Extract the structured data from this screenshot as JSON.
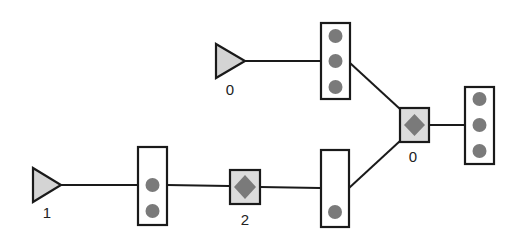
{
  "diagram": {
    "type": "network-topology",
    "colors": {
      "stroke": "#1a1a1a",
      "triangle_fill": "#d4d4d4",
      "switch_fill": "#dcdcdc",
      "packet_dot": "#7a7a7a",
      "buffer_fill": "#ffffff"
    },
    "sources": [
      {
        "id": "source-0",
        "label": "0"
      },
      {
        "id": "source-1",
        "label": "1"
      }
    ],
    "switches": [
      {
        "id": "switch-0",
        "label": "0"
      },
      {
        "id": "switch-2",
        "label": "2"
      }
    ],
    "buffers": [
      {
        "id": "buffer-top",
        "packets": 3
      },
      {
        "id": "buffer-right",
        "packets": 3
      },
      {
        "id": "buffer-left",
        "packets": 2
      },
      {
        "id": "buffer-bottom",
        "packets": 1
      }
    ],
    "edges": [
      [
        "source-0",
        "buffer-top"
      ],
      [
        "buffer-top",
        "switch-0"
      ],
      [
        "switch-0",
        "buffer-right"
      ],
      [
        "source-1",
        "buffer-left"
      ],
      [
        "buffer-left",
        "switch-2"
      ],
      [
        "switch-2",
        "buffer-bottom"
      ],
      [
        "buffer-bottom",
        "switch-0"
      ]
    ]
  }
}
